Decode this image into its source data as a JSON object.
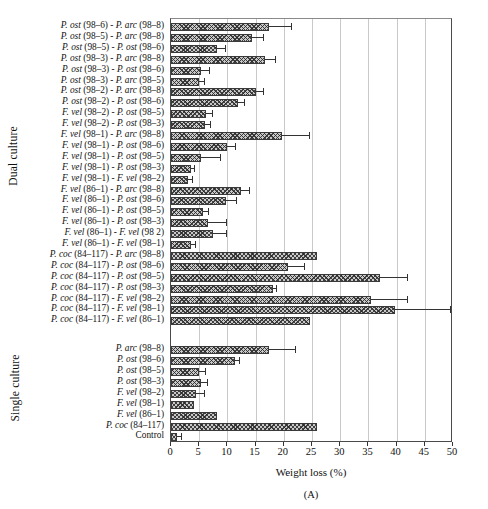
{
  "axis_labels": {
    "dual": "Dual culture",
    "single": "Single culture"
  },
  "chart_data": {
    "type": "bar",
    "orientation": "horizontal",
    "title": "",
    "subtitle": "",
    "panel_letter": "(A)",
    "xlabel": "Weight loss (%)",
    "ylabel": "",
    "xlim": [
      0,
      50
    ],
    "xticks": [
      0,
      5,
      10,
      15,
      20,
      25,
      30,
      35,
      40,
      45,
      50
    ],
    "grid": "vertical",
    "legend": "none",
    "group_labels": [
      "Dual culture",
      "Single culture"
    ],
    "categories": [
      "P. ost (98–6) - P. arc (98–8)",
      "P. ost (98–5) - P. arc (98–8)",
      "P. ost (98–5) - P. ost (98–6)",
      "P. ost (98–3) - P. arc (98–8)",
      "P. ost (98–3) - P. ost (98–6)",
      "P. ost (98–3) - P. arc (98–5)",
      "P. ost (98–2) - P. arc (98–8)",
      "P. ost (98–2) - P. ost (98–6)",
      "F. vel (98–2) - P. ost (98–5)",
      "F. vel (98–2) - P. ost (98–3)",
      "F. vel (98–1) - P. arc (98–8)",
      "F. vel (98–1) - P. ost (98–6)",
      "F. vel (98–1) - P. ost (98–5)",
      "F. vel (98–1) - P. ost (98–3)",
      "F. vel (98–1) - F. vel (98–2)",
      "F. vel (86–1) - P. arc (98–8)",
      "F. vel (86–1) - P. ost (98–6)",
      "F. vel (86–1) - P. ost (98–5)",
      "F. vel (86–1) - P. ost (98–3)",
      "F. vel (86–1) - F. vel (98 2)",
      "F. vel (86–1) - F. vel (98–1)",
      "P. coc (84–117) - P. arc (98–8)",
      "P. coc (84–117) - P. ost (98–6)",
      "P. coc (84–117) - P. ost (98–5)",
      "P. coc (84–117) - P. ost (98–3)",
      "P. coc (84–117) - F. vel (98–2)",
      "P. coc (84–117) - F. vel (98–1)",
      "P. coc (84–117) - F. vel (86–1)",
      "P. arc (98–8)",
      "P. ost (98–6)",
      "P. ost (98–5)",
      "P. ost (98–3)",
      "F. vel (98–2)",
      "F. vel (98–1)",
      "F. vel (86–1)",
      "P. coc (84–117)",
      "Control"
    ],
    "values": [
      17.3,
      14.3,
      8.2,
      16.7,
      5.3,
      4.9,
      15.1,
      11.8,
      6.2,
      6.0,
      19.7,
      10.0,
      5.4,
      3.6,
      3.0,
      12.4,
      9.8,
      5.6,
      6.6,
      7.5,
      3.5,
      25.8,
      20.7,
      37.0,
      18.0,
      35.5,
      39.7,
      24.6,
      17.3,
      11.3,
      4.9,
      5.4,
      4.5,
      4.0,
      8.2,
      25.9,
      1.0
    ],
    "errors": [
      4.0,
      2.0,
      1.3,
      1.7,
      1.4,
      1.0,
      1.3,
      1.2,
      1.1,
      0.9,
      4.7,
      1.3,
      3.2,
      0.5,
      0.7,
      1.5,
      1.7,
      0.9,
      3.2,
      2.2,
      0.8,
      0.0,
      2.8,
      4.9,
      0.6,
      6.3,
      9.8,
      0.0,
      4.6,
      0.8,
      1.2,
      0.9,
      1.4,
      0.0,
      0.0,
      0.0,
      0.7
    ],
    "group_spans": [
      {
        "label": "Dual culture",
        "start": 0,
        "end": 27
      },
      {
        "label": "Single culture",
        "start": 28,
        "end": 36
      }
    ]
  }
}
